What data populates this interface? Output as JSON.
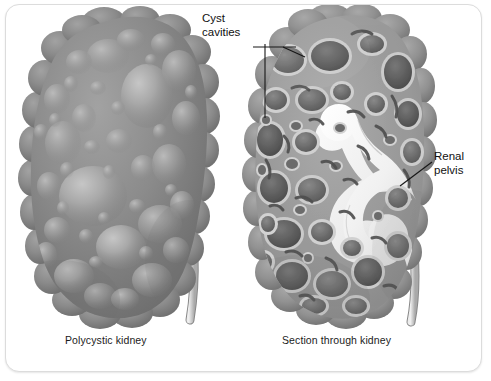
{
  "figure": {
    "panels": [
      {
        "id": "left",
        "caption": "Polycystic kidney"
      },
      {
        "id": "right",
        "caption": "Section through kidney"
      }
    ],
    "callouts": [
      {
        "id": "cyst-cavities",
        "line1": "Cyst",
        "line2": "cavities"
      },
      {
        "id": "renal-pelvis",
        "line1": "Renal",
        "line2": "pelvis"
      }
    ],
    "colors": {
      "background": "#ffffff",
      "frame_border": "#dcdcdc",
      "text": "#111111",
      "caption_text": "#1b1b1b",
      "leader_line": "#161616",
      "kidney_body": "#8d8d8d",
      "kidney_body_dark": "#6f6f6f",
      "cyst_highlight": "#b4b4b4",
      "cyst_cavity_fill": "#707070",
      "cyst_rim": "#c9c9c9",
      "septa_tissue": "#9a9a9a",
      "renal_pelvis": "#f2f2f2",
      "ureter": "#dadada",
      "ureter_outline": "#5e5e5e"
    }
  }
}
